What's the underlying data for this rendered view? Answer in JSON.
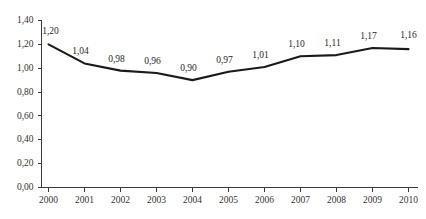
{
  "chart_data": {
    "type": "line",
    "title": "",
    "subtitle": "",
    "xlabel": "",
    "ylabel": "",
    "categories": [
      "2000",
      "2001",
      "2002",
      "2003",
      "2004",
      "2005",
      "2006",
      "2007",
      "2008",
      "2009",
      "2010"
    ],
    "values": [
      1.2,
      1.04,
      0.98,
      0.96,
      0.9,
      0.97,
      1.01,
      1.1,
      1.11,
      1.17,
      1.16
    ],
    "point_labels": [
      "1,20",
      "1,04",
      "0,98",
      "0,96",
      "0,90",
      "0,97",
      "1,01",
      "1,10",
      "1,11",
      "1,17",
      "1,16"
    ],
    "ylim": [
      0.0,
      1.4
    ],
    "yticks": [
      0.0,
      0.2,
      0.4,
      0.6,
      0.8,
      1.0,
      1.2,
      1.4
    ],
    "ytick_labels": [
      "0,00",
      "0,20",
      "0,40",
      "0,60",
      "0,80",
      "1,00",
      "1,20",
      "1,40"
    ],
    "grid": false,
    "legend": null,
    "legend_position": "none",
    "decimal_separator": ",",
    "series_color": "#1a1a1a",
    "axis_color": "#3a3a38",
    "background_color": "#ffffff",
    "annotations": []
  }
}
